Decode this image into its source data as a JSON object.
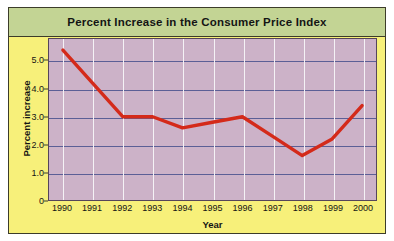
{
  "chart_data": {
    "type": "line",
    "title": "Percent Increase in the Consumer Price Index",
    "xlabel": "Year",
    "ylabel": "Percent increase",
    "categories": [
      "1990",
      "1991",
      "1992",
      "1993",
      "1994",
      "1995",
      "1996",
      "1997",
      "1998",
      "1999",
      "2000"
    ],
    "values": [
      5.4,
      4.2,
      3.0,
      3.0,
      2.6,
      2.8,
      3.0,
      2.3,
      1.6,
      2.2,
      3.4
    ],
    "series": [
      {
        "name": "Percent increase in CPI",
        "values": [
          5.4,
          4.2,
          3.0,
          3.0,
          2.6,
          2.8,
          3.0,
          2.3,
          1.6,
          2.2,
          3.4
        ]
      }
    ],
    "ylim": [
      0,
      5.8
    ],
    "yticks": [
      "0",
      "1.0",
      "2.0",
      "3.0",
      "4.0",
      "5.0"
    ],
    "ytick_values": [
      0,
      1.0,
      2.0,
      3.0,
      4.0,
      5.0
    ],
    "grid": "horizontal-and-vertical",
    "legend": "none",
    "line_color": "#d42a1a",
    "plot_background": "#ccb2c8",
    "panel_background": "#f7f07a",
    "title_background": "#c3d494",
    "gridline_color": "#5b5f96",
    "vertical_gridline_color": "#f4f2f6"
  }
}
